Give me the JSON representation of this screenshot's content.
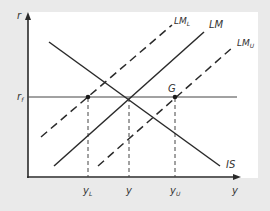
{
  "diagram": {
    "type": "IS-LM diagram",
    "axes": {
      "y_axis_label": "r",
      "x_axis_label": "y"
    },
    "rate_label": {
      "main": "r",
      "sub": "f"
    },
    "curves": {
      "is": {
        "label": "IS",
        "style": "solid"
      },
      "lm": {
        "label": "LM",
        "style": "solid"
      },
      "lm_l": {
        "label_main": "LM",
        "label_sub": "L",
        "style": "dashed"
      },
      "lm_u": {
        "label_main": "LM",
        "label_sub": "U",
        "style": "dashed"
      }
    },
    "points": {
      "g": {
        "label": "G"
      }
    },
    "x_ticks": {
      "y_l": {
        "main": "y",
        "sub": "L"
      },
      "y": {
        "main": "y"
      },
      "y_u": {
        "main": "y",
        "sub": "U"
      }
    },
    "colors": {
      "background": "#eaeaea",
      "plot_background": "#ffffff",
      "line": "#2a2a2a"
    }
  }
}
